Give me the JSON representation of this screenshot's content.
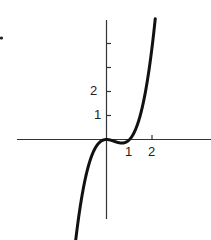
{
  "chart_data": {
    "type": "line",
    "title": "",
    "xlabel": "",
    "ylabel": "",
    "function": "y = x^3 - x^2",
    "series": [
      {
        "name": "curve",
        "x": [
          -1.33,
          -1.0,
          -0.75,
          -0.5,
          -0.25,
          0.0,
          0.25,
          0.5,
          0.667,
          0.75,
          1.0,
          1.25,
          1.5,
          1.75,
          2.0,
          2.15
        ],
        "values": [
          -4.12,
          -2.0,
          -0.98,
          -0.375,
          -0.078,
          0.0,
          -0.047,
          -0.125,
          -0.148,
          -0.141,
          0.0,
          0.391,
          1.125,
          2.297,
          4.0,
          5.31
        ]
      }
    ],
    "x_ticks": [
      1,
      2
    ],
    "x_tick_labels": [
      "1",
      "2"
    ],
    "y_ticks": [
      1,
      2,
      3,
      4
    ],
    "y_tick_labels": [
      "1",
      "2",
      "",
      ""
    ],
    "xlim": [
      -3.9,
      4.6
    ],
    "ylim": [
      -3.3,
      5.0
    ],
    "grid": false,
    "legend": "none"
  },
  "labels": {
    "x1": "1",
    "x2": "2",
    "y1": "1",
    "y2": "2"
  }
}
